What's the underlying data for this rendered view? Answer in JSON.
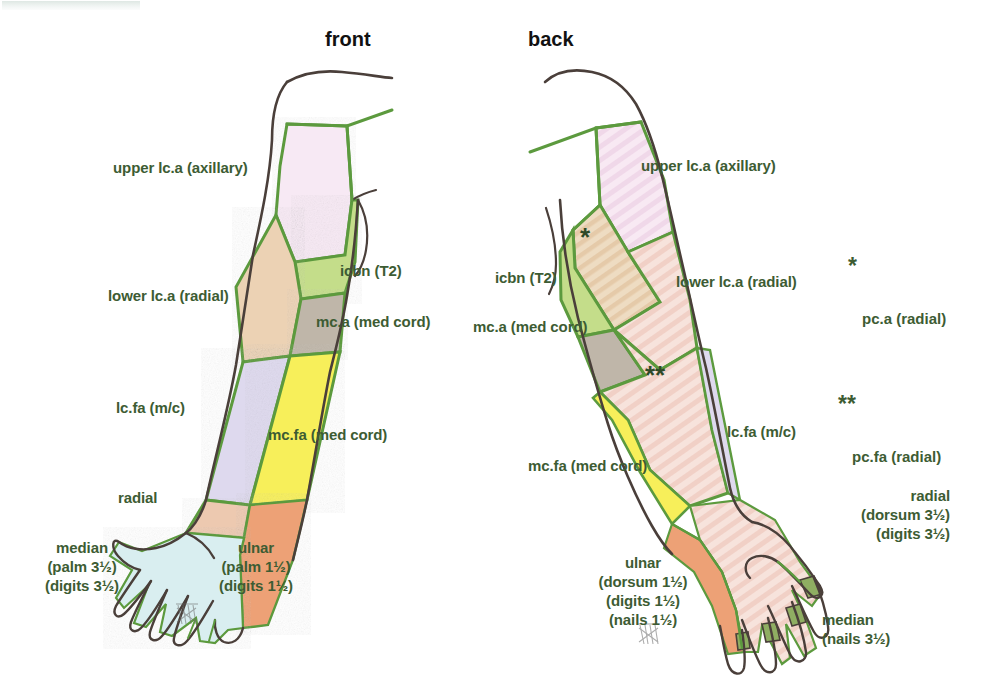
{
  "figure": {
    "views": [
      {
        "id": "front",
        "label": "front"
      },
      {
        "id": "back",
        "label": "back"
      }
    ]
  },
  "front_labels": {
    "upper_lca": "upper lc.a (axillary)",
    "lower_lca": "lower lc.a (radial)",
    "icbn": "icbn (T2)",
    "mca": "mc.a (med cord)",
    "lcfa": "lc.fa (m/c)",
    "mcfa": "mc.fa (med cord)",
    "radial": "radial",
    "median": "median\n(palm 3½)\n(digits 3½)",
    "ulnar": "ulnar\n(palm 1½)\n(digits 1½)"
  },
  "back_labels": {
    "upper_lca": "upper lc.a (axillary)",
    "icbn": "icbn (T2)",
    "lower_lca": "lower lc.a (radial)",
    "mca": "mc.a (med cord)",
    "lcfa": "lc.fa (m/c)",
    "mcfa": "mc.fa (med cord)",
    "radial": "radial\n(dorsum 3½)\n(digits 3½)",
    "ulnar": "ulnar\n(dorsum 1½)\n(digits 1½)\n(nails 1½)",
    "median": "median\n(nails 3½)"
  },
  "in_figure_marks": {
    "single_star": "*",
    "double_star": "**"
  },
  "legend": [
    {
      "marker": "*",
      "text": "pc.a (radial)"
    },
    {
      "marker": "**",
      "text": "pc.fa (radial)"
    }
  ],
  "colors": {
    "label_green": "#3d5c33",
    "title_black": "#111111",
    "boundary_green": "#5c9a3e",
    "outline_ink": "#4a3f3a",
    "upper_lca_pink": "#f6e6f2",
    "icbn_green": "#c2dd8c",
    "lower_lca_tan": "#eccfae",
    "mca_grey": "#c0b8ab",
    "lcfa_lavender": "#ded9ee",
    "mcfa_yellow": "#f7ef5a",
    "radial_orange": "#eda276",
    "median_palm_cyan": "#d8eef0",
    "dorsum_pink": "#f3d8d2",
    "nail_green": "#8fae62"
  }
}
